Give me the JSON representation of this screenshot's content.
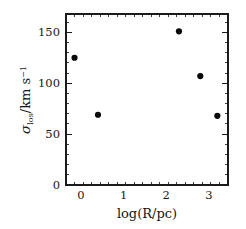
{
  "chart_data": {
    "type": "scatter",
    "title": "",
    "xlabel": "log(R/pc)",
    "ylabel": "sigma_los/km s^-1",
    "ylabel_parts": {
      "symbol": "σ",
      "subscript": "los",
      "unit_numerator": "/km s",
      "unit_exponent": "−1"
    },
    "xlim": [
      -0.35,
      3.45
    ],
    "ylim": [
      0,
      168
    ],
    "xticks": [
      0,
      1,
      2,
      3
    ],
    "yticks": [
      0,
      50,
      100,
      150
    ],
    "xtick_labels": [
      "0",
      "1",
      "2",
      "3"
    ],
    "ytick_labels": [
      "0",
      "50",
      "100",
      "150"
    ],
    "x_minor_tick_interval": 0.2,
    "y_minor_tick_interval": 10,
    "grid": false,
    "legend": null,
    "marker_style": "filled-circle",
    "marker_color": "#080808",
    "series": [
      {
        "name": "velocity dispersion measurements",
        "points": [
          {
            "x": -0.15,
            "y": 125
          },
          {
            "x": 0.4,
            "y": 69
          },
          {
            "x": 2.3,
            "y": 151
          },
          {
            "x": 2.8,
            "y": 107
          },
          {
            "x": 3.2,
            "y": 68
          }
        ]
      }
    ]
  },
  "figure": {
    "background_color": "#ffffff",
    "frame_color": "#1b1b1b"
  }
}
